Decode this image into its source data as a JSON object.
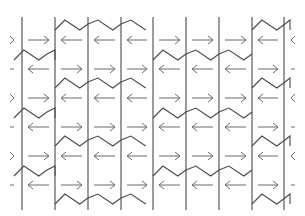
{
  "diagram": {
    "type": "arrow-zigzag-tessellation",
    "stroke_color": "#4a4a4a",
    "arrow_color": "#6a6a6a",
    "background": "#ffffff",
    "vertical_lines_x": [
      22,
      55,
      88,
      121,
      153,
      186,
      219,
      252,
      284
    ],
    "vertical_line_span": [
      17,
      210
    ],
    "cells_x": [
      [
        22,
        55
      ],
      [
        55,
        88
      ],
      [
        88,
        121
      ],
      [
        121,
        153
      ],
      [
        153,
        186
      ],
      [
        186,
        219
      ],
      [
        219,
        252
      ],
      [
        252,
        284
      ]
    ],
    "rows": [
      {
        "y": 40,
        "left_edge": "chevron-right",
        "arrows": [
          "right",
          "left",
          "left",
          "left",
          "right",
          "right",
          "right",
          "left"
        ],
        "right_edge": "chevron-left"
      },
      {
        "y": 69,
        "left_edge": "dash",
        "arrows": [
          "left",
          "right",
          "right",
          "right",
          "left",
          "left",
          "left",
          "right"
        ],
        "right_edge": "dash"
      },
      {
        "y": 98,
        "left_edge": "chevron-right",
        "arrows": [
          "right",
          "left",
          "left",
          "left",
          "right",
          "right",
          "right",
          "left"
        ],
        "right_edge": "chevron-left"
      },
      {
        "y": 127,
        "left_edge": "dash",
        "arrows": [
          "left",
          "right",
          "right",
          "right",
          "left",
          "left",
          "left",
          "right"
        ],
        "right_edge": "dash"
      },
      {
        "y": 156,
        "left_edge": "chevron-right",
        "arrows": [
          "right",
          "left",
          "left",
          "left",
          "right",
          "right",
          "right",
          "left"
        ],
        "right_edge": "chevron-left"
      },
      {
        "y": 185,
        "left_edge": "dash",
        "arrows": [
          "left",
          "right",
          "right",
          "right",
          "left",
          "left",
          "left",
          "right"
        ],
        "right_edge": "dash"
      }
    ],
    "zigzags": [
      {
        "name": "zigzag-a",
        "y_top": 20,
        "segments": [
          [
            55,
            153
          ],
          [
            252,
            290
          ]
        ]
      },
      {
        "name": "zigzag-b",
        "y_top": 50,
        "segments": [
          [
            14,
            55
          ],
          [
            153,
            252
          ]
        ]
      },
      {
        "name": "zigzag-a",
        "y_top": 78,
        "segments": [
          [
            55,
            153
          ],
          [
            252,
            290
          ]
        ]
      },
      {
        "name": "zigzag-b",
        "y_top": 108,
        "segments": [
          [
            14,
            55
          ],
          [
            153,
            252
          ]
        ]
      },
      {
        "name": "zigzag-a",
        "y_top": 136,
        "segments": [
          [
            55,
            153
          ],
          [
            252,
            290
          ]
        ]
      },
      {
        "name": "zigzag-b",
        "y_top": 166,
        "segments": [
          [
            14,
            55
          ],
          [
            153,
            252
          ]
        ]
      },
      {
        "name": "zigzag-a",
        "y_top": 194,
        "segments": [
          [
            55,
            153
          ],
          [
            252,
            290
          ]
        ]
      }
    ]
  }
}
